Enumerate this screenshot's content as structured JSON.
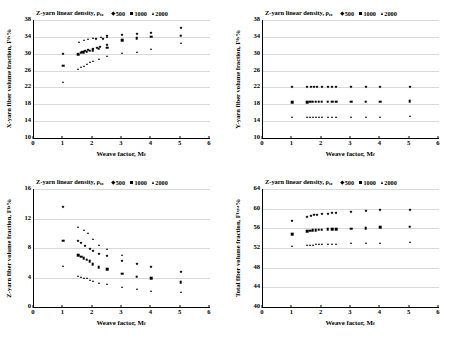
{
  "legend": {
    "title_main": "Z-yarn linear density, ",
    "title_sym": "ρ",
    "title_sub": "tz",
    "items": [
      {
        "label": "500",
        "marker": "diamond"
      },
      {
        "label": "1000",
        "marker": "square"
      },
      {
        "label": "2000",
        "marker": "triangle"
      }
    ]
  },
  "chart_data": [
    {
      "type": "scatter",
      "panel": "top-left",
      "title": "Z-yarn linear density, ρtz",
      "xlabel": "Weave factor, Mf",
      "xlabel_main": "Weave factor, M",
      "xlabel_sub": "f",
      "ylabel_main": "X-yarn fiber volume fraction,  F",
      "ylabel_sub": "fx",
      "ylabel_tail": "%",
      "xlim": [
        0,
        6
      ],
      "ylim": [
        10,
        38
      ],
      "xticks": [
        0,
        1,
        2,
        3,
        4,
        5,
        6
      ],
      "yticks": [
        10,
        14,
        18,
        22,
        26,
        30,
        34,
        38
      ],
      "grid": true,
      "series": [
        {
          "name": "500",
          "marker": "diamond",
          "points": [
            [
              1.0,
              30.0
            ],
            [
              1.5,
              29.9
            ],
            [
              1.65,
              30.3
            ],
            [
              1.75,
              30.6
            ],
            [
              1.85,
              30.8
            ],
            [
              2.0,
              31.1
            ],
            [
              2.15,
              31.3
            ],
            [
              2.25,
              31.6
            ],
            [
              2.5,
              32.0
            ],
            [
              2.5,
              34.1
            ],
            [
              3.0,
              34.4
            ],
            [
              3.5,
              34.7
            ],
            [
              4.0,
              35.0
            ],
            [
              5.0,
              36.0
            ],
            [
              2.1,
              33.5
            ],
            [
              2.35,
              33.6
            ]
          ]
        },
        {
          "name": "1000",
          "marker": "square",
          "points": [
            [
              1.0,
              27.2
            ],
            [
              1.5,
              29.8
            ],
            [
              1.6,
              30.2
            ],
            [
              1.7,
              30.4
            ],
            [
              1.8,
              30.5
            ],
            [
              1.9,
              30.7
            ],
            [
              2.0,
              30.9
            ],
            [
              2.2,
              31.2
            ],
            [
              2.5,
              31.4
            ],
            [
              3.0,
              33.2
            ],
            [
              3.5,
              33.7
            ],
            [
              4.0,
              34.0
            ],
            [
              5.0,
              34.3
            ]
          ]
        },
        {
          "name": "2000",
          "marker": "triangle",
          "points": [
            [
              1.0,
              23.4
            ],
            [
              1.5,
              26.4
            ],
            [
              1.6,
              26.8
            ],
            [
              1.7,
              27.2
            ],
            [
              1.8,
              27.5
            ],
            [
              1.9,
              28.0
            ],
            [
              2.0,
              28.3
            ],
            [
              2.2,
              28.7
            ],
            [
              2.5,
              29.4
            ],
            [
              3.0,
              30.1
            ],
            [
              3.5,
              30.5
            ],
            [
              4.0,
              31.2
            ],
            [
              5.0,
              32.6
            ],
            [
              1.55,
              32.8
            ],
            [
              1.7,
              33.2
            ],
            [
              1.85,
              33.5
            ],
            [
              2.0,
              33.7
            ],
            [
              2.3,
              33.9
            ],
            [
              2.5,
              34.0
            ]
          ]
        }
      ]
    },
    {
      "type": "scatter",
      "panel": "top-right",
      "title": "Z-yarn linear density, ρtz",
      "xlabel_main": "Weave factor, M",
      "xlabel_sub": "f",
      "ylabel_main": "Y-yarn fiber volume fraction,  F",
      "ylabel_sub": "fy",
      "ylabel_tail": "%",
      "xlim": [
        0,
        6
      ],
      "ylim": [
        10,
        38
      ],
      "xticks": [
        0,
        1,
        2,
        3,
        4,
        5,
        6
      ],
      "yticks": [
        10,
        14,
        18,
        22,
        26,
        30,
        34,
        38
      ],
      "grid": true,
      "series": [
        {
          "name": "500",
          "marker": "diamond",
          "points": [
            [
              1.0,
              22.0
            ],
            [
              1.5,
              22.0
            ],
            [
              1.65,
              22.0
            ],
            [
              1.75,
              22.0
            ],
            [
              1.85,
              22.0
            ],
            [
              2.0,
              22.0
            ],
            [
              2.2,
              22.0
            ],
            [
              2.35,
              22.0
            ],
            [
              2.5,
              22.0
            ],
            [
              3.0,
              22.0
            ],
            [
              3.5,
              22.0
            ],
            [
              4.0,
              22.0
            ],
            [
              5.0,
              22.1
            ]
          ]
        },
        {
          "name": "1000",
          "marker": "square",
          "points": [
            [
              1.0,
              18.5
            ],
            [
              1.5,
              18.5
            ],
            [
              1.6,
              18.6
            ],
            [
              1.7,
              18.6
            ],
            [
              1.8,
              18.6
            ],
            [
              1.9,
              18.6
            ],
            [
              2.0,
              18.6
            ],
            [
              2.2,
              18.6
            ],
            [
              2.35,
              18.6
            ],
            [
              2.5,
              18.6
            ],
            [
              3.0,
              18.6
            ],
            [
              3.5,
              18.6
            ],
            [
              4.0,
              18.6
            ],
            [
              5.0,
              18.7
            ]
          ]
        },
        {
          "name": "2000",
          "marker": "triangle",
          "points": [
            [
              1.0,
              15.0
            ],
            [
              1.5,
              15.0
            ],
            [
              1.6,
              15.0
            ],
            [
              1.7,
              15.0
            ],
            [
              1.8,
              15.0
            ],
            [
              1.9,
              15.0
            ],
            [
              2.0,
              15.0
            ],
            [
              2.2,
              15.0
            ],
            [
              2.35,
              15.0
            ],
            [
              2.5,
              15.0
            ],
            [
              3.0,
              15.0
            ],
            [
              3.5,
              15.0
            ],
            [
              4.0,
              15.1
            ],
            [
              5.0,
              15.2
            ]
          ]
        }
      ]
    },
    {
      "type": "scatter",
      "panel": "bottom-left",
      "title": "Z-yarn linear density, ρtz",
      "xlabel_main": "Weave factor, M",
      "xlabel_sub": "f",
      "ylabel_main": "Z-yarn fiber volume fraction,  F",
      "ylabel_sub": "fz",
      "ylabel_tail": "%",
      "xlim": [
        0,
        6
      ],
      "ylim": [
        0,
        16
      ],
      "xticks": [
        0,
        1,
        2,
        3,
        4,
        5,
        6
      ],
      "yticks": [
        0,
        4,
        8,
        12,
        16
      ],
      "grid": true,
      "series": [
        {
          "name": "500",
          "marker": "diamond",
          "points": [
            [
              1.0,
              13.5
            ],
            [
              1.5,
              9.0
            ],
            [
              1.6,
              8.7
            ],
            [
              1.75,
              8.3
            ],
            [
              1.9,
              7.9
            ],
            [
              2.0,
              7.6
            ],
            [
              2.2,
              7.2
            ],
            [
              2.5,
              6.9
            ],
            [
              3.0,
              6.3
            ],
            [
              3.5,
              5.8
            ],
            [
              4.0,
              5.4
            ],
            [
              5.0,
              4.8
            ]
          ]
        },
        {
          "name": "1000",
          "marker": "square",
          "points": [
            [
              1.0,
              9.0
            ],
            [
              1.5,
              7.0
            ],
            [
              1.6,
              6.8
            ],
            [
              1.7,
              6.6
            ],
            [
              1.8,
              6.4
            ],
            [
              1.9,
              6.2
            ],
            [
              2.0,
              5.8
            ],
            [
              2.2,
              5.4
            ],
            [
              2.5,
              5.1
            ],
            [
              3.0,
              4.5
            ],
            [
              3.5,
              4.1
            ],
            [
              4.0,
              3.9
            ],
            [
              5.0,
              3.4
            ]
          ]
        },
        {
          "name": "2000",
          "marker": "triangle",
          "points": [
            [
              1.0,
              5.6
            ],
            [
              1.5,
              4.2
            ],
            [
              1.6,
              4.1
            ],
            [
              1.7,
              4.0
            ],
            [
              1.8,
              3.9
            ],
            [
              1.9,
              3.7
            ],
            [
              2.0,
              3.5
            ],
            [
              2.2,
              3.3
            ],
            [
              2.5,
              3.1
            ],
            [
              3.0,
              2.7
            ],
            [
              3.5,
              2.4
            ],
            [
              4.0,
              2.2
            ],
            [
              5.0,
              2.0
            ],
            [
              1.5,
              10.8
            ],
            [
              1.7,
              10.4
            ],
            [
              1.85,
              10.0
            ],
            [
              2.0,
              9.2
            ],
            [
              2.2,
              8.4
            ],
            [
              2.5,
              7.9
            ],
            [
              3.0,
              7.1
            ]
          ]
        }
      ]
    },
    {
      "type": "scatter",
      "panel": "bottom-right",
      "title": "Z-yarn linear density, ρtz",
      "xlabel_main": "Weave factor, M",
      "xlabel_sub": "f",
      "ylabel_main": "Total fiber volume fraction,  F",
      "ylabel_sub": "fxyz",
      "ylabel_tail": "%",
      "xlim": [
        0,
        6
      ],
      "ylim": [
        40,
        64
      ],
      "xticks": [
        0,
        1,
        2,
        3,
        4,
        5,
        6
      ],
      "yticks": [
        40,
        44,
        48,
        52,
        56,
        60,
        64
      ],
      "grid": true,
      "series": [
        {
          "name": "500",
          "marker": "diamond",
          "points": [
            [
              1.0,
              57.4
            ],
            [
              1.5,
              58.4
            ],
            [
              1.65,
              58.6
            ],
            [
              1.75,
              58.7
            ],
            [
              1.85,
              58.8
            ],
            [
              2.0,
              58.9
            ],
            [
              2.2,
              59.0
            ],
            [
              2.35,
              59.1
            ],
            [
              2.5,
              59.2
            ],
            [
              3.0,
              59.4
            ],
            [
              3.5,
              59.6
            ],
            [
              4.0,
              59.7
            ],
            [
              5.0,
              59.8
            ]
          ]
        },
        {
          "name": "1000",
          "marker": "square",
          "points": [
            [
              1.0,
              54.8
            ],
            [
              1.5,
              55.4
            ],
            [
              1.6,
              55.5
            ],
            [
              1.7,
              55.6
            ],
            [
              1.8,
              55.6
            ],
            [
              1.9,
              55.7
            ],
            [
              2.0,
              55.7
            ],
            [
              2.2,
              55.8
            ],
            [
              2.35,
              55.8
            ],
            [
              2.5,
              55.8
            ],
            [
              3.0,
              55.9
            ],
            [
              3.5,
              56.0
            ],
            [
              4.0,
              56.2
            ],
            [
              5.0,
              56.3
            ]
          ]
        },
        {
          "name": "2000",
          "marker": "triangle",
          "points": [
            [
              1.0,
              52.4
            ],
            [
              1.5,
              52.6
            ],
            [
              1.6,
              52.7
            ],
            [
              1.7,
              52.7
            ],
            [
              1.8,
              52.8
            ],
            [
              1.9,
              52.8
            ],
            [
              2.0,
              52.8
            ],
            [
              2.2,
              52.9
            ],
            [
              2.35,
              52.9
            ],
            [
              2.5,
              52.9
            ],
            [
              3.0,
              53.0
            ],
            [
              3.5,
              53.0
            ],
            [
              4.0,
              53.1
            ],
            [
              5.0,
              53.2
            ]
          ]
        }
      ]
    }
  ]
}
